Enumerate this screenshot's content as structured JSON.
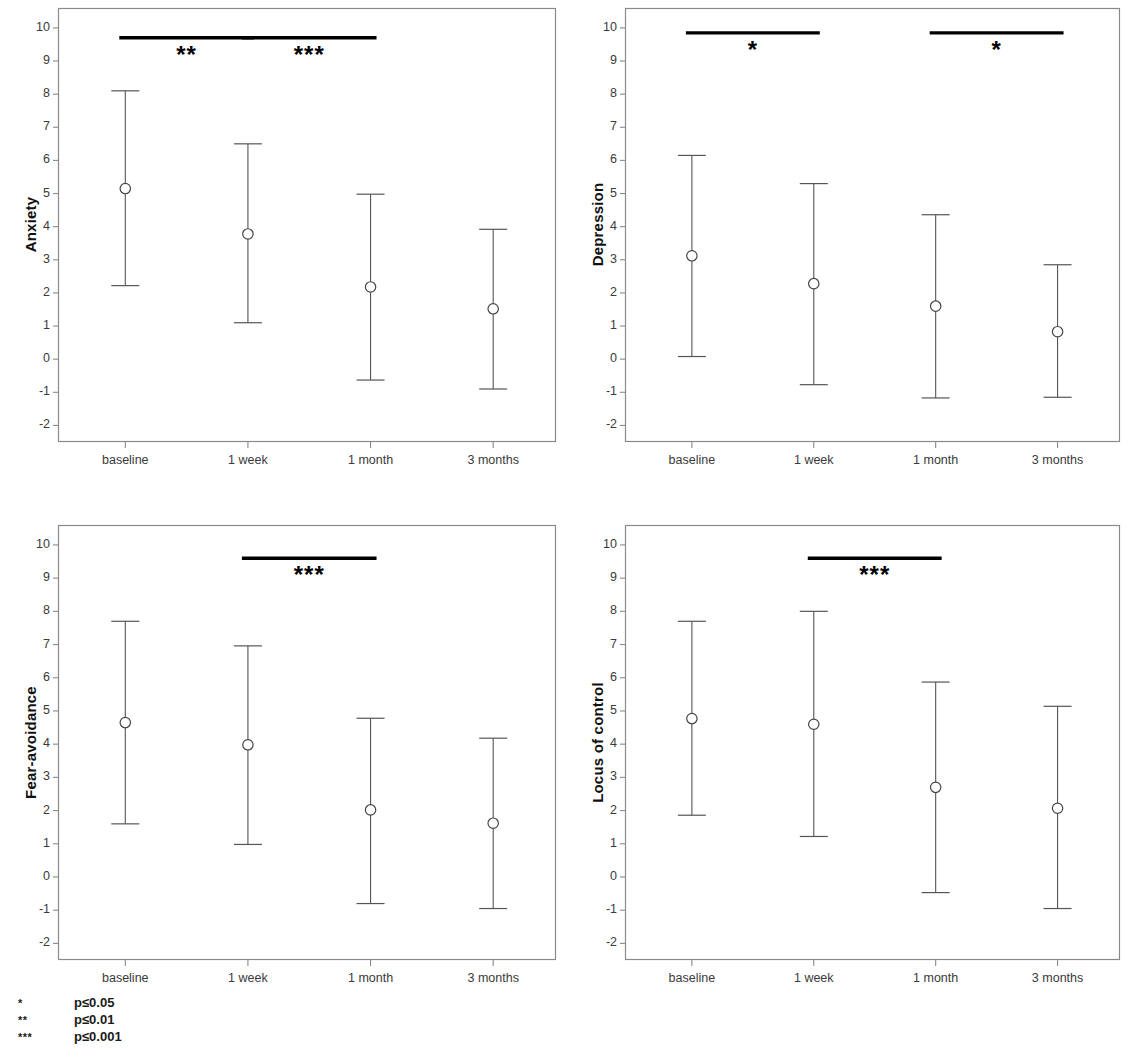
{
  "figure": {
    "legend": {
      "rows": [
        {
          "mark": "*",
          "text": "p≤0.05"
        },
        {
          "mark": "**",
          "text": "p≤0.01"
        },
        {
          "mark": "***",
          "text": "p≤0.001"
        }
      ]
    }
  },
  "chart_data": [
    {
      "type": "scatter",
      "panel": "top-left",
      "title": "",
      "ylabel": "Anxiety",
      "xlabel": "",
      "categories": [
        "baseline",
        "1 week",
        "1 month",
        "3 months"
      ],
      "ylim": [
        -2.5,
        10.6
      ],
      "yticks": [
        10,
        9,
        8,
        7,
        6,
        5,
        4,
        3,
        2,
        1,
        0,
        -1,
        -2
      ],
      "ytick_labels": [
        "10",
        "9",
        "8",
        "7",
        "6",
        "5",
        "4",
        "3",
        "2",
        "1",
        "0",
        "-1",
        "-2"
      ],
      "grid": false,
      "legend_position": "none",
      "series": [
        {
          "name": "Anxiety mean ± SD",
          "values": [
            5.15,
            3.78,
            2.18,
            1.52
          ],
          "error_low": [
            2.22,
            1.1,
            -0.63,
            -0.9
          ],
          "error_high": [
            8.1,
            6.5,
            4.98,
            3.92
          ]
        }
      ],
      "annotations": [
        {
          "label": "**",
          "from": "baseline",
          "to": "1 week",
          "y": 9.7
        },
        {
          "label": "***",
          "from": "1 week",
          "to": "1 month",
          "y": 9.7
        }
      ]
    },
    {
      "type": "scatter",
      "panel": "top-right",
      "title": "",
      "ylabel": "Depression",
      "xlabel": "",
      "categories": [
        "baseline",
        "1 week",
        "1 month",
        "3 months"
      ],
      "ylim": [
        -2.5,
        10.6
      ],
      "yticks": [
        10,
        9,
        8,
        7,
        6,
        5,
        4,
        3,
        2,
        1,
        0,
        -1,
        -2
      ],
      "ytick_labels": [
        "10",
        "9",
        "8",
        "7",
        "6",
        "5",
        "4",
        "3",
        "2",
        "1",
        "0",
        "-1",
        "-2"
      ],
      "grid": false,
      "legend_position": "none",
      "series": [
        {
          "name": "Depression mean ± SD",
          "values": [
            3.12,
            2.28,
            1.6,
            0.83
          ],
          "error_low": [
            0.08,
            -0.77,
            -1.17,
            -1.15
          ],
          "error_high": [
            6.15,
            5.3,
            4.36,
            2.85
          ]
        }
      ],
      "annotations": [
        {
          "label": "*",
          "from": "baseline",
          "to": "1 week",
          "y": 9.85
        },
        {
          "label": "*",
          "from": "1 month",
          "to": "3 months",
          "y": 9.85
        }
      ]
    },
    {
      "type": "scatter",
      "panel": "bottom-left",
      "title": "",
      "ylabel": "Fear-avoidance",
      "xlabel": "",
      "categories": [
        "baseline",
        "1 week",
        "1 month",
        "3 months"
      ],
      "ylim": [
        -2.5,
        10.6
      ],
      "yticks": [
        10,
        9,
        8,
        7,
        6,
        5,
        4,
        3,
        2,
        1,
        0,
        -1,
        -2
      ],
      "ytick_labels": [
        "10",
        "9",
        "8",
        "7",
        "6",
        "5",
        "4",
        "3",
        "2",
        "1",
        "0",
        "-1",
        "-2"
      ],
      "grid": false,
      "legend_position": "none",
      "series": [
        {
          "name": "Fear-avoidance mean ± SD",
          "values": [
            4.65,
            3.98,
            2.02,
            1.62
          ],
          "error_low": [
            1.6,
            0.98,
            -0.8,
            -0.95
          ],
          "error_high": [
            7.7,
            6.96,
            4.78,
            4.18
          ]
        }
      ],
      "annotations": [
        {
          "label": "***",
          "from": "1 week",
          "to": "1 month",
          "y": 9.6
        }
      ]
    },
    {
      "type": "scatter",
      "panel": "bottom-right",
      "title": "",
      "ylabel": "Locus of control",
      "xlabel": "",
      "categories": [
        "baseline",
        "1 week",
        "1 month",
        "3 months"
      ],
      "ylim": [
        -2.5,
        10.6
      ],
      "yticks": [
        10,
        9,
        8,
        7,
        6,
        5,
        4,
        3,
        2,
        1,
        0,
        -1,
        -2
      ],
      "ytick_labels": [
        "10",
        "9",
        "8",
        "7",
        "6",
        "5",
        "4",
        "3",
        "2",
        "1",
        "0",
        "-1",
        "-2"
      ],
      "grid": false,
      "legend_position": "none",
      "series": [
        {
          "name": "Locus of control mean ± SD",
          "values": [
            4.77,
            4.6,
            2.7,
            2.07
          ],
          "error_low": [
            1.86,
            1.22,
            -0.47,
            -0.95
          ],
          "error_high": [
            7.7,
            8.0,
            5.87,
            5.14
          ]
        }
      ],
      "annotations": [
        {
          "label": "***",
          "from": "1 week",
          "to": "1 month",
          "y": 9.6
        }
      ]
    }
  ]
}
